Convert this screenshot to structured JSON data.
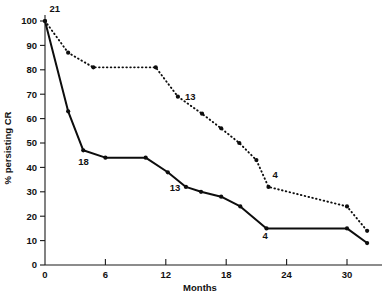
{
  "chart_data": {
    "type": "line",
    "title": "",
    "xlabel": "Months",
    "ylabel": "% persisting CR",
    "xlim": [
      0,
      32.5
    ],
    "ylim": [
      0,
      100
    ],
    "grid": false,
    "legend": "none",
    "xticks": [
      0,
      6,
      12,
      18,
      24,
      30
    ],
    "xtick_labels": [
      "0",
      "6",
      "12",
      "18",
      "24",
      "30"
    ],
    "yticks": [
      0,
      10,
      20,
      30,
      40,
      50,
      60,
      70,
      80,
      90,
      100
    ],
    "ytick_labels": [
      "0",
      "10",
      "20",
      "30",
      "40",
      "50",
      "60",
      "70",
      "80",
      "90",
      "100"
    ],
    "series": [
      {
        "name": "dotted-curve",
        "style": "dotted",
        "x": [
          0,
          2.3,
          4.8,
          11.0,
          13.2,
          15.6,
          17.5,
          19.3,
          21.0,
          22.2,
          30.0,
          32.0
        ],
        "y": [
          100,
          87,
          81,
          81,
          69,
          62,
          56,
          50,
          43,
          32,
          24,
          14
        ]
      },
      {
        "name": "solid-curve",
        "style": "solid",
        "x": [
          0,
          2.3,
          3.8,
          6.0,
          10.0,
          12.2,
          14.0,
          15.5,
          17.5,
          19.4,
          22.0,
          30.0,
          32.0
        ],
        "y": [
          100,
          63,
          47,
          44,
          44,
          38,
          32,
          30,
          28,
          24,
          15,
          15,
          9
        ]
      }
    ],
    "annotations": [
      {
        "text": "21",
        "x": 0.45,
        "y": 103.5,
        "series": "top"
      },
      {
        "text": "13",
        "x": 13.9,
        "y": 67.5,
        "series": "dotted"
      },
      {
        "text": "4",
        "x": 22.6,
        "y": 35.5,
        "series": "dotted"
      },
      {
        "text": "18",
        "x": 3.3,
        "y": 41.0,
        "series": "solid"
      },
      {
        "text": "13",
        "x": 12.4,
        "y": 30.5,
        "series": "solid"
      },
      {
        "text": "4",
        "x": 21.6,
        "y": 10.5,
        "series": "solid"
      }
    ]
  },
  "colors": {
    "line": "#0d0d0d",
    "axis": "#1a1a1a",
    "background": "#ffffff"
  }
}
